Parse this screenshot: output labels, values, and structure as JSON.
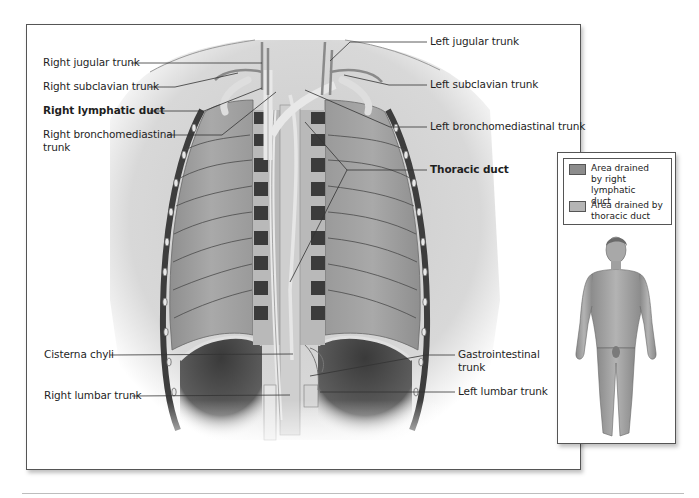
{
  "figure": {
    "labels_left": [
      {
        "id": "right-jugular-trunk",
        "text": "Right jugular trunk",
        "bold": false
      },
      {
        "id": "right-subclavian-trunk",
        "text": "Right subclavian trunk",
        "bold": false
      },
      {
        "id": "right-lymphatic-duct",
        "text": "Right lymphatic duct",
        "bold": true
      },
      {
        "id": "right-bronchomediastinal-trunk",
        "text": "Right bronchomediastinal\ntrunk",
        "bold": false
      },
      {
        "id": "cisterna-chyli",
        "text": "Cisterna chyli",
        "bold": false
      },
      {
        "id": "right-lumbar-trunk",
        "text": "Right lumbar trunk",
        "bold": false
      }
    ],
    "labels_right": [
      {
        "id": "left-jugular-trunk",
        "text": "Left jugular trunk",
        "bold": false
      },
      {
        "id": "left-subclavian-trunk",
        "text": "Left subclavian trunk",
        "bold": false
      },
      {
        "id": "left-bronchomediastinal-trunk",
        "text": "Left bronchomediastinal trunk",
        "bold": false
      },
      {
        "id": "thoracic-duct",
        "text": "Thoracic duct",
        "bold": true
      },
      {
        "id": "gastrointestinal-trunk",
        "text": "Gastrointestinal\ntrunk",
        "bold": false
      },
      {
        "id": "left-lumbar-trunk",
        "text": "Left lumbar trunk",
        "bold": false
      }
    ],
    "legend": {
      "items": [
        {
          "label": "Area drained\nby right lymphatic\nduct",
          "color": "#8c8c8c"
        },
        {
          "label": "Area drained by\nthoracic duct",
          "color": "#b5b5b5"
        }
      ]
    }
  }
}
